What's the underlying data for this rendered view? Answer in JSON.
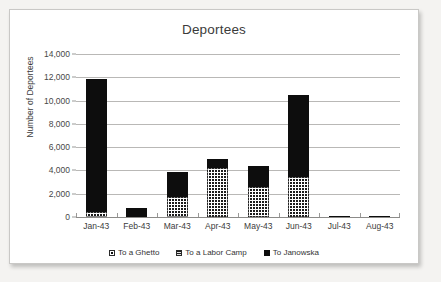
{
  "chart_data": {
    "type": "bar",
    "title": "Deportees",
    "xlabel": "",
    "ylabel": "Number of Deportees",
    "ylim": [
      0,
      14000
    ],
    "ytick_step": 2000,
    "yticks": [
      "0",
      "2,000",
      "4,000",
      "6,000",
      "8,000",
      "10,000",
      "12,000",
      "14,000"
    ],
    "grid": true,
    "stacked": true,
    "legend_position": "bottom",
    "categories": [
      "Jan-43",
      "Feb-43",
      "Mar-43",
      "Apr-43",
      "May-43",
      "Jun-43",
      "Jul-43",
      "Aug-43"
    ],
    "series": [
      {
        "name": "To a Ghetto",
        "pattern": "crosshatch",
        "values": [
          400,
          0,
          1700,
          4200,
          2600,
          3400,
          0,
          0
        ]
      },
      {
        "name": "To a Labor Camp",
        "pattern": "horizontal-lines",
        "values": [
          0,
          0,
          0,
          0,
          0,
          0,
          0,
          0
        ]
      },
      {
        "name": "To Janowska",
        "pattern": "solid-black",
        "values": [
          11440,
          800,
          2200,
          800,
          1750,
          7050,
          80,
          60
        ]
      }
    ],
    "totals": [
      11840,
      800,
      3900,
      5000,
      4350,
      10450,
      80,
      60
    ]
  },
  "legend": {
    "items": [
      {
        "label": "To a Ghetto"
      },
      {
        "label": "To a Labor Camp"
      },
      {
        "label": "To Janowska"
      }
    ]
  },
  "colors": {
    "ghetto": "#ffffff",
    "labor": "#8e8e8e",
    "janowska": "#0d0d0d",
    "gridline": "#b9b8b6",
    "axis": "#8c8b89",
    "text": "#3b3b3b",
    "plot_background": "#ffffff",
    "page_background": "#f4f3f1"
  }
}
